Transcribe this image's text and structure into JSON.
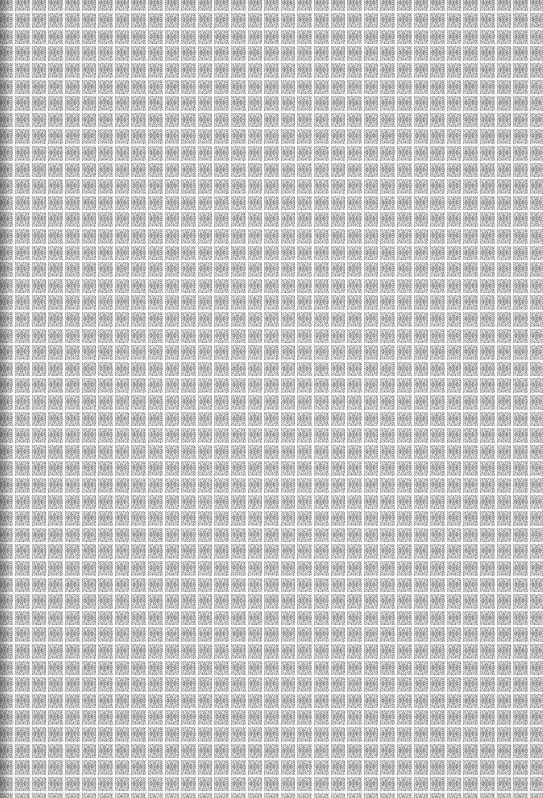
{
  "image": {
    "kind": "texture-swatch",
    "description": "Uniform grid of noisy gray square cells separated by white gridlines",
    "width_px": 543,
    "height_px": 798,
    "background_color": "#f2f2f2"
  },
  "grid": {
    "cell_pitch_px": 16.6,
    "gridline_width_px": 2,
    "gridline_color": "#fbfbfb",
    "columns_visible": 33,
    "rows_visible": 48,
    "offset_x_px": -4,
    "offset_y_px": -6,
    "edges_clipped": "all",
    "left_edge_sliver_px": 6,
    "right_edge_sliver_px": 8,
    "top_edge_sliver_px": 10,
    "bottom_edge_sliver_px": 4
  },
  "cell": {
    "fill_base_color": "#bcbcbc",
    "noise_light_color": "#efefef",
    "noise_dark_color": "#8d8d8d",
    "center_blob_color": "#9a9a9a",
    "center_blob_radius_px": 3,
    "noise_pixel_size_px": 1,
    "noise_amplitude": 46,
    "symmetry": "mirrored-horizontal-and-vertical"
  },
  "shading": {
    "left_band_darken": 0.1,
    "left_band_width_px": 10,
    "vignette_strength": 0.04
  },
  "render": {
    "noise_seed": 20240517
  }
}
